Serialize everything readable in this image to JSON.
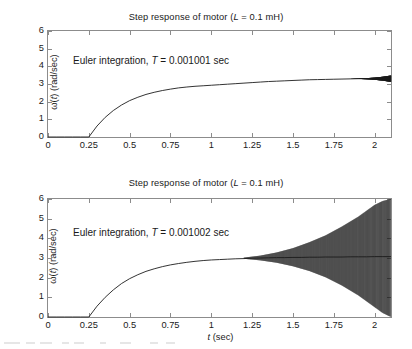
{
  "figure": {
    "background": "#ffffff",
    "axis_color": "#8c8c8c",
    "curve_color": "#1a1a1a"
  },
  "chart_data": [
    {
      "type": "line",
      "id": "top",
      "title": "Step response of motor (L = 0.1 mH)",
      "title_parts": {
        "pre": "Step response of motor (",
        "italic": "L",
        "post": " = 0.1 mH)"
      },
      "annotation": "Euler integration, T = 0.001001 sec",
      "annotation_parts": {
        "pre": "Euler integration, ",
        "italic": "T",
        "post": " = 0.001001 sec"
      },
      "xlabel": "",
      "ylabel": "ω(t) (rad/sec)",
      "ylabel_parts": {
        "pre": "ω(",
        "italic": "t",
        "post": ") (rad/sec)"
      },
      "xlim": [
        0,
        2.1
      ],
      "ylim": [
        0,
        6
      ],
      "xticks": [
        0,
        0.25,
        0.5,
        0.75,
        1,
        1.25,
        1.5,
        1.75,
        2
      ],
      "xtick_labels": [
        "0",
        "0.25",
        "0.5",
        "0.75",
        "1",
        "1.25",
        "1.5",
        "1.75",
        "2"
      ],
      "yticks": [
        0,
        1,
        2,
        3,
        4,
        5,
        6
      ],
      "ytick_labels": [
        "0",
        "1",
        "2",
        "3",
        "4",
        "5",
        "6"
      ],
      "grid": false,
      "legend": "none",
      "step_time": 0.25,
      "steady_state": 3.3,
      "description": "Stable Euler integration: output holds at 0 until t = 0.25 s, then rises exponentially to a steady value near 3.3 rad/sec with only a very slight thickening (small numerical oscillation) after t = 1.9 s.",
      "x": [
        0,
        0.05,
        0.1,
        0.15,
        0.2,
        0.25,
        0.3,
        0.35,
        0.4,
        0.45,
        0.5,
        0.55,
        0.6,
        0.65,
        0.7,
        0.75,
        0.8,
        0.85,
        0.9,
        0.95,
        1,
        1.05,
        1.1,
        1.15,
        1.2,
        1.25,
        1.3,
        1.35,
        1.4,
        1.45,
        1.5,
        1.55,
        1.6,
        1.65,
        1.7,
        1.75,
        1.8,
        1.85,
        1.9,
        1.95,
        2,
        2.05,
        2.1
      ],
      "y": [
        0,
        0,
        0,
        0,
        0,
        0,
        0.62,
        1.11,
        1.5,
        1.81,
        2.06,
        2.25,
        2.41,
        2.53,
        2.63,
        2.71,
        2.78,
        2.83,
        2.87,
        2.9,
        2.93,
        2.96,
        2.99,
        3.02,
        3.05,
        3.08,
        3.11,
        3.14,
        3.16,
        3.18,
        3.2,
        3.22,
        3.24,
        3.25,
        3.26,
        3.27,
        3.28,
        3.29,
        3.3,
        3.3,
        3.31,
        3.32,
        3.33
      ],
      "envelope_upper": [
        3.3,
        3.31,
        3.33,
        3.36,
        3.41,
        3.48
      ],
      "envelope_lower": [
        3.3,
        3.29,
        3.27,
        3.24,
        3.19,
        3.12
      ],
      "envelope_x": [
        1.85,
        1.9,
        1.95,
        2.0,
        2.05,
        2.1
      ]
    },
    {
      "type": "line",
      "id": "bottom",
      "title": "Step response of motor (L = 0.1 mH)",
      "title_parts": {
        "pre": "Step response of motor (",
        "italic": "L",
        "post": " = 0.1 mH)"
      },
      "annotation": "Euler integration, T = 0.001002 sec",
      "annotation_parts": {
        "pre": "Euler integration, ",
        "italic": "T",
        "post": " = 0.001002 sec"
      },
      "xlabel": "t (sec)",
      "xlabel_parts": {
        "italic": "t",
        "post": " (sec)"
      },
      "ylabel": "ω(t) (rad/sec)",
      "ylabel_parts": {
        "pre": "ω(",
        "italic": "t",
        "post": ") (rad/sec)"
      },
      "xlim": [
        0,
        2.1
      ],
      "ylim": [
        0,
        6
      ],
      "xticks": [
        0,
        0.25,
        0.5,
        0.75,
        1,
        1.25,
        1.5,
        1.75,
        2
      ],
      "xtick_labels": [
        "0",
        "0.25",
        "0.5",
        "0.75",
        "1",
        "1.25",
        "1.5",
        "1.75",
        "2"
      ],
      "yticks": [
        0,
        1,
        2,
        3,
        4,
        5,
        6
      ],
      "ytick_labels": [
        "0",
        "1",
        "2",
        "3",
        "4",
        "5",
        "6"
      ],
      "grid": false,
      "legend": "none",
      "step_time": 0.25,
      "steady_state": 3.0,
      "description": "Unstable Euler integration: same exponential rise to about 3 rad/sec, then a numerical oscillation whose envelope grows exponentially from about t = 1.2 s until it fills the full 0 to 6 rad/sec range near t = 2.1 s.",
      "x": [
        0,
        0.05,
        0.1,
        0.15,
        0.2,
        0.25,
        0.3,
        0.35,
        0.4,
        0.45,
        0.5,
        0.55,
        0.6,
        0.65,
        0.7,
        0.75,
        0.8,
        0.85,
        0.9,
        0.95,
        1,
        1.05,
        1.1,
        1.15,
        1.2,
        1.25,
        1.3,
        1.35,
        1.4,
        1.45,
        1.5,
        1.55,
        1.6,
        1.65,
        1.7,
        1.75,
        1.8,
        1.85,
        1.9,
        1.95,
        2,
        2.05,
        2.1
      ],
      "y": [
        0,
        0,
        0,
        0,
        0,
        0,
        0.55,
        1.0,
        1.38,
        1.7,
        1.95,
        2.15,
        2.32,
        2.45,
        2.56,
        2.65,
        2.72,
        2.78,
        2.83,
        2.87,
        2.9,
        2.92,
        2.94,
        2.96,
        2.97,
        2.99,
        3.0,
        3.01,
        3.02,
        3.02,
        3.03,
        3.03,
        3.04,
        3.04,
        3.05,
        3.05,
        3.05,
        3.06,
        3.06,
        3.06,
        3.07,
        3.07,
        3.07
      ],
      "envelope_x": [
        1.2,
        1.3,
        1.4,
        1.5,
        1.6,
        1.7,
        1.8,
        1.9,
        2.0,
        2.05,
        2.1
      ],
      "envelope_upper": [
        3.02,
        3.12,
        3.28,
        3.5,
        3.8,
        4.15,
        4.6,
        5.1,
        5.7,
        5.9,
        6.0
      ],
      "envelope_lower": [
        2.96,
        2.88,
        2.76,
        2.58,
        2.34,
        2.02,
        1.6,
        1.1,
        0.5,
        0.2,
        0.0
      ]
    }
  ]
}
